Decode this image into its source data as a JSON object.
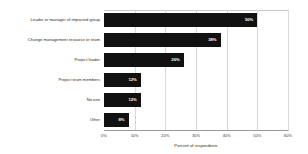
{
  "chart_data": {
    "type": "bar",
    "orientation": "horizontal",
    "title": "",
    "subtitle": "",
    "xlabel": "Percent of respondents",
    "ylabel": "",
    "categories": [
      "Leader or manager of impacted group",
      "Change management resource or team",
      "Project leader",
      "Project team members",
      "No one",
      "Other"
    ],
    "values": [
      50,
      38,
      26,
      12,
      12,
      8
    ],
    "data_labels": [
      "50%",
      "38%",
      "26%",
      "12%",
      "12%",
      "8%"
    ],
    "xlim": [
      0,
      60
    ],
    "xticks": [
      0,
      10,
      20,
      30,
      40,
      50,
      60
    ],
    "xtick_labels": [
      "0%",
      "10%",
      "20%",
      "30%",
      "40%",
      "50%",
      "60%"
    ],
    "grid": true,
    "legend": false,
    "bar_color": "#111111",
    "label_color": "#ffffff",
    "grid_color": "#d8d8d8",
    "axis_color": "#9a9a9a",
    "background": "#ffffff"
  }
}
